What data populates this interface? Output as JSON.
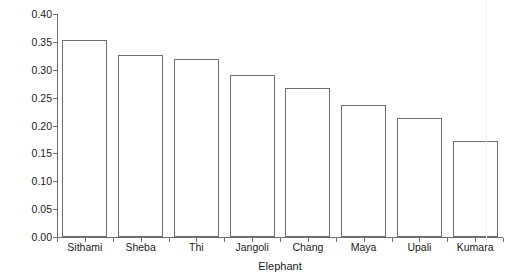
{
  "chart_data": {
    "type": "bar",
    "title": "",
    "subtitle": "",
    "xlabel": "Elephant",
    "ylabel": "Mean monthly association index",
    "categories": [
      "Sithami",
      "Sheba",
      "Thi",
      "Jangoli",
      "Chang",
      "Maya",
      "Upali",
      "Kumara"
    ],
    "values": [
      0.354,
      0.326,
      0.319,
      0.29,
      0.267,
      0.237,
      0.214,
      0.172
    ],
    "series": [
      {
        "name": "Mean monthly association index",
        "values": [
          0.354,
          0.326,
          0.319,
          0.29,
          0.267,
          0.237,
          0.214,
          0.172
        ]
      }
    ],
    "ylim": [
      0.0,
      0.4
    ],
    "ytick_values": [
      0.0,
      0.05,
      0.1,
      0.15,
      0.2,
      0.25,
      0.3,
      0.35,
      0.4
    ],
    "ytick_labels": [
      "0.00",
      "0.05",
      "0.10",
      "0.15",
      "0.20",
      "0.25",
      "0.30",
      "0.35",
      "0.40"
    ],
    "grid": false,
    "legend": null,
    "legend_position": "none",
    "bar_fill_color": "#ffffff",
    "bar_edge_color": "#6e6e6e",
    "axis_color": "#6e6e6e",
    "text_color": "#1a1a1a",
    "background_color": "#ffffff",
    "annotations": []
  }
}
